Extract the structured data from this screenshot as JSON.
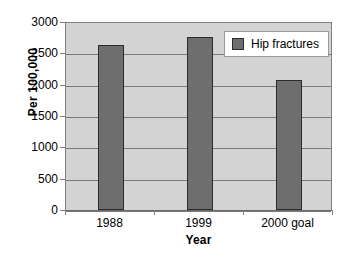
{
  "chart_data": {
    "type": "bar",
    "title": "",
    "xlabel": "Year",
    "ylabel": "Per 100,000",
    "categories": [
      "1988",
      "1999",
      "2000 goal"
    ],
    "values": [
      2630,
      2760,
      2080
    ],
    "series": [
      {
        "name": "Hip fractures",
        "values": [
          2630,
          2760,
          2080
        ],
        "color": "#6e6e6e"
      }
    ],
    "ylim": [
      0,
      3000
    ],
    "y_ticks": [
      0,
      500,
      1000,
      1500,
      2000,
      2500,
      3000
    ],
    "y_tick_labels": [
      "0",
      "500",
      "1000",
      "1500",
      "2000",
      "2500",
      "3000"
    ],
    "grid": true,
    "legend": {
      "position": "top-right",
      "entries": [
        {
          "label": "Hip fractures",
          "color": "#6e6e6e"
        }
      ]
    },
    "plot_background": "#d3d3d3",
    "figure_background": "#ffffff"
  },
  "axes": {
    "y_title": "Per 100,000",
    "x_title": "Year"
  },
  "legend_entry_0_label": "Hip fractures"
}
